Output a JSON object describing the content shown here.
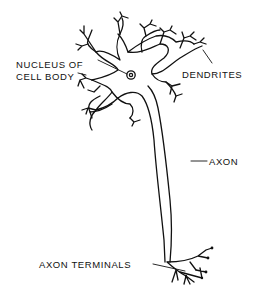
{
  "diagram": {
    "labels": {
      "nucleus_line1": "NUCLEUS OF",
      "nucleus_line2": "CELL BODY",
      "dendrites": "DENDRITES",
      "axon": "AXON",
      "axon_terminals": "AXON TERMINALS"
    },
    "colors": {
      "line": "#111111",
      "background": "#ffffff"
    }
  }
}
